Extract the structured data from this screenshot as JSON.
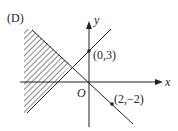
{
  "option_label": "(D)",
  "axes": {
    "x_label": "x",
    "y_label": "y",
    "origin_label": "O"
  },
  "points": [
    {
      "label": "(0,3)",
      "x": 0,
      "y": 3
    },
    {
      "label": "(2,−2)",
      "x": 2,
      "y": -2
    }
  ],
  "lines": [
    {
      "name": "line-through-0-3",
      "description": "ascending line through (0,3)"
    },
    {
      "name": "line-through-origin",
      "description": "descending line through O and (2,-2)"
    }
  ],
  "shaded_region": {
    "style": "diagonal-hatch",
    "position": "left of both lines' intersection"
  },
  "colors": {
    "ink": "#222222",
    "background": "#ffffff"
  }
}
